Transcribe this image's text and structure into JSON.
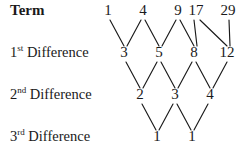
{
  "diagram": {
    "background_color": "#ffffff",
    "text_color": "#1a1a1a",
    "line_color": "#1a1a1a",
    "rows": [
      {
        "label_prefix": "Term",
        "label_ordinal": "",
        "label_suffix": "",
        "bold": true,
        "y": 14,
        "values": [
          "1",
          "4",
          "9",
          "17",
          "29"
        ],
        "x_positions": [
          108,
          143,
          178,
          196,
          228
        ]
      },
      {
        "label_prefix": "1",
        "label_ordinal": "st",
        "label_suffix": " Difference",
        "bold": false,
        "y": 56,
        "values": [
          "3",
          "5",
          "8",
          "12"
        ],
        "x_positions": [
          124,
          159,
          194,
          227
        ]
      },
      {
        "label_prefix": "2",
        "label_ordinal": "nd",
        "label_suffix": " Difference",
        "bold": false,
        "y": 98,
        "values": [
          "2",
          "3",
          "4"
        ],
        "x_positions": [
          140,
          175,
          210
        ]
      },
      {
        "label_prefix": "3",
        "label_ordinal": "rd",
        "label_suffix": " Difference",
        "bold": false,
        "y": 140,
        "values": [
          "1",
          "1"
        ],
        "x_positions": [
          157,
          192
        ]
      }
    ],
    "connectors": [
      {
        "x1": 110,
        "y1": 20,
        "x2": 124,
        "y2": 46
      },
      {
        "x1": 141,
        "y1": 20,
        "x2": 127,
        "y2": 46
      },
      {
        "x1": 145,
        "y1": 20,
        "x2": 159,
        "y2": 46
      },
      {
        "x1": 176,
        "y1": 20,
        "x2": 162,
        "y2": 46
      },
      {
        "x1": 180,
        "y1": 20,
        "x2": 194,
        "y2": 46
      },
      {
        "x1": 194,
        "y1": 20,
        "x2": 197,
        "y2": 46
      },
      {
        "x1": 200,
        "y1": 20,
        "x2": 227,
        "y2": 46
      },
      {
        "x1": 229,
        "y1": 20,
        "x2": 230,
        "y2": 46
      },
      {
        "x1": 126,
        "y1": 62,
        "x2": 140,
        "y2": 88
      },
      {
        "x1": 157,
        "y1": 62,
        "x2": 143,
        "y2": 88
      },
      {
        "x1": 161,
        "y1": 62,
        "x2": 175,
        "y2": 88
      },
      {
        "x1": 192,
        "y1": 62,
        "x2": 178,
        "y2": 88
      },
      {
        "x1": 196,
        "y1": 62,
        "x2": 210,
        "y2": 88
      },
      {
        "x1": 227,
        "y1": 62,
        "x2": 213,
        "y2": 88
      },
      {
        "x1": 142,
        "y1": 104,
        "x2": 156,
        "y2": 130
      },
      {
        "x1": 173,
        "y1": 104,
        "x2": 159,
        "y2": 130
      },
      {
        "x1": 177,
        "y1": 104,
        "x2": 191,
        "y2": 130
      },
      {
        "x1": 208,
        "y1": 104,
        "x2": 194,
        "y2": 130
      }
    ]
  },
  "chart_data": {
    "type": "table",
    "row_labels": [
      "Term",
      "1st Difference",
      "2nd Difference",
      "3rd Difference"
    ],
    "series": [
      {
        "name": "Term",
        "values": [
          1,
          4,
          9,
          17,
          29
        ]
      },
      {
        "name": "1st Difference",
        "values": [
          3,
          5,
          8,
          12
        ]
      },
      {
        "name": "2nd Difference",
        "values": [
          2,
          3,
          4
        ]
      },
      {
        "name": "3rd Difference",
        "values": [
          1,
          1
        ]
      }
    ]
  }
}
